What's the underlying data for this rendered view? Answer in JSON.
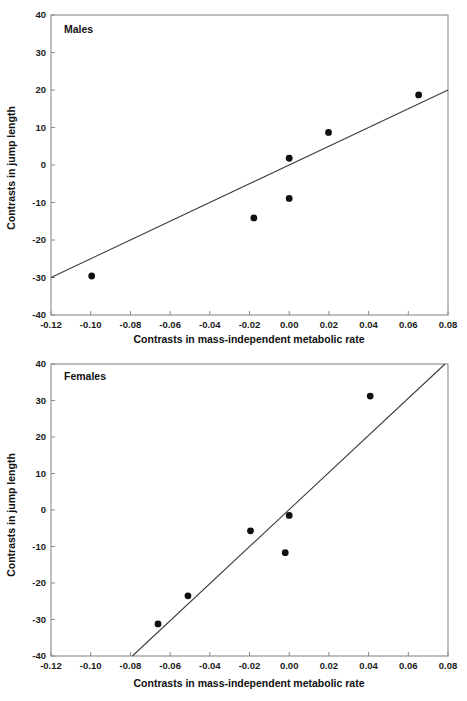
{
  "figure": {
    "background_color": "#ffffff",
    "axis_color": "#8a8a8a",
    "line_color": "#3a3a3a",
    "point_color": "#101010"
  },
  "panels": {
    "males": {
      "label": "Males",
      "xlabel": "Contrasts in mass-independent metabolic rate",
      "ylabel": "Contrasts in jump length"
    },
    "females": {
      "label": "Females",
      "xlabel": "Contrasts in mass-independent metabolic rate",
      "ylabel": "Contrasts in jump length"
    }
  },
  "axis_labels": {
    "x_ticks": [
      "-0.12",
      "-0.10",
      "-0.08",
      "-0.06",
      "-0.04",
      "-0.02",
      "0.00",
      "0.02",
      "0.04",
      "0.06",
      "0.08"
    ],
    "y_ticks": [
      "40",
      "30",
      "20",
      "10",
      "0",
      "-10",
      "-20",
      "-30",
      "-40"
    ]
  },
  "chart_data": [
    {
      "type": "scatter",
      "title": "Males",
      "xlabel": "Contrasts in mass-independent metabolic rate",
      "ylabel": "Contrasts in jump length",
      "xlim": [
        -0.12,
        0.08
      ],
      "ylim": [
        -40,
        40
      ],
      "xticks": [
        -0.12,
        -0.1,
        -0.08,
        -0.06,
        -0.04,
        -0.02,
        0.0,
        0.02,
        0.04,
        0.06,
        0.08
      ],
      "yticks": [
        -40,
        -30,
        -20,
        -10,
        0,
        10,
        20,
        30,
        40
      ],
      "grid": false,
      "legend": "none",
      "points": [
        {
          "x": -0.0995,
          "y": -29.6
        },
        {
          "x": -0.0178,
          "y": -14.1
        },
        {
          "x": 0.0,
          "y": -8.9
        },
        {
          "x": 0.0,
          "y": 1.8
        },
        {
          "x": 0.0198,
          "y": 8.7
        },
        {
          "x": 0.0652,
          "y": 18.7
        }
      ],
      "series": [
        {
          "name": "regression-line",
          "type": "line",
          "x": [
            -0.12,
            0.08
          ],
          "y": [
            -30.0,
            20.0
          ]
        }
      ],
      "annotations": [
        {
          "text": "Males",
          "x": -0.112,
          "y": 35.5
        }
      ]
    },
    {
      "type": "scatter",
      "title": "Females",
      "xlabel": "Contrasts in mass-independent metabolic rate",
      "ylabel": "Contrasts in jump length",
      "xlim": [
        -0.12,
        0.08
      ],
      "ylim": [
        -40,
        40
      ],
      "xticks": [
        -0.12,
        -0.1,
        -0.08,
        -0.06,
        -0.04,
        -0.02,
        0.0,
        0.02,
        0.04,
        0.06,
        0.08
      ],
      "yticks": [
        -40,
        -30,
        -20,
        -10,
        0,
        10,
        20,
        30,
        40
      ],
      "grid": false,
      "legend": "none",
      "points": [
        {
          "x": -0.0661,
          "y": -31.2
        },
        {
          "x": -0.051,
          "y": -23.5
        },
        {
          "x": -0.0195,
          "y": -5.7
        },
        {
          "x": -0.002,
          "y": -11.7
        },
        {
          "x": 0.0,
          "y": -1.5
        },
        {
          "x": 0.0408,
          "y": 31.2
        }
      ],
      "series": [
        {
          "name": "regression-line",
          "type": "line",
          "x": [
            -0.079,
            0.0785
          ],
          "y": [
            -40.0,
            40.0
          ]
        }
      ],
      "annotations": [
        {
          "text": "Females",
          "x": -0.112,
          "y": 34.5
        }
      ]
    }
  ]
}
